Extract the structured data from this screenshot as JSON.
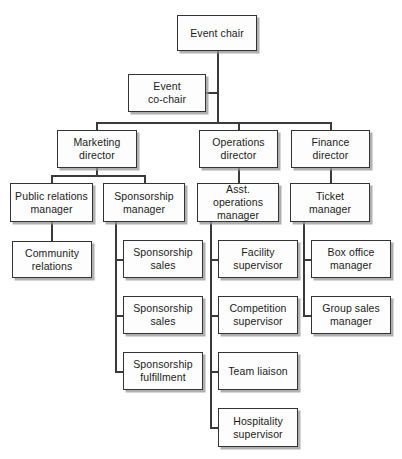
{
  "chart": {
    "type": "org-chart",
    "nodes": [
      {
        "id": "event-chair",
        "label": "Event chair",
        "level": 0,
        "x": 177,
        "y": 15,
        "w": 80,
        "h": 36
      },
      {
        "id": "event-co-chair",
        "label": "Event\nco-chair",
        "level": 1,
        "x": 128,
        "y": 74,
        "w": 78,
        "h": 38
      },
      {
        "id": "marketing-director",
        "label": "Marketing\ndirector",
        "level": 2,
        "x": 57,
        "y": 130,
        "w": 80,
        "h": 38
      },
      {
        "id": "operations-director",
        "label": "Operations\ndirector",
        "level": 2,
        "x": 199,
        "y": 130,
        "w": 79,
        "h": 38
      },
      {
        "id": "finance-director",
        "label": "Finance\ndirector",
        "level": 2,
        "x": 291,
        "y": 130,
        "w": 79,
        "h": 38
      },
      {
        "id": "public-relations-manager",
        "label": "Public relations\nmanager",
        "level": 3,
        "x": 10,
        "y": 183,
        "w": 83,
        "h": 39
      },
      {
        "id": "sponsorship-manager",
        "label": "Sponsorship\nmanager",
        "level": 3,
        "x": 103,
        "y": 183,
        "w": 82,
        "h": 39
      },
      {
        "id": "asst-operations-manager",
        "label": "Asst. operations\nmanager",
        "level": 3,
        "x": 197,
        "y": 183,
        "w": 82,
        "h": 39
      },
      {
        "id": "ticket-manager",
        "label": "Ticket\nmanager",
        "level": 3,
        "x": 290,
        "y": 183,
        "w": 80,
        "h": 39
      },
      {
        "id": "community-relations",
        "label": "Community\nrelations",
        "level": 4,
        "x": 12,
        "y": 241,
        "w": 80,
        "h": 37
      },
      {
        "id": "sponsorship-sales-1",
        "label": "Sponsorship\nsales",
        "level": 4,
        "x": 123,
        "y": 240,
        "w": 80,
        "h": 38
      },
      {
        "id": "sponsorship-sales-2",
        "label": "Sponsorship\nsales",
        "level": 4,
        "x": 123,
        "y": 296,
        "w": 80,
        "h": 38
      },
      {
        "id": "sponsorship-fulfillment",
        "label": "Sponsorship\nfulfillment",
        "level": 4,
        "x": 123,
        "y": 352,
        "w": 80,
        "h": 38
      },
      {
        "id": "facility-supervisor",
        "label": "Facility\nsupervisor",
        "level": 4,
        "x": 218,
        "y": 240,
        "w": 80,
        "h": 38
      },
      {
        "id": "competition-supervisor",
        "label": "Competition\nsupervisor",
        "level": 4,
        "x": 218,
        "y": 296,
        "w": 80,
        "h": 38
      },
      {
        "id": "team-liaison",
        "label": "Team liaison",
        "level": 4,
        "x": 218,
        "y": 352,
        "w": 80,
        "h": 38
      },
      {
        "id": "hospitality-supervisor",
        "label": "Hospitality\nsupervisor",
        "level": 4,
        "x": 218,
        "y": 408,
        "w": 80,
        "h": 39
      },
      {
        "id": "box-office-manager",
        "label": "Box office\nmanager",
        "level": 4,
        "x": 311,
        "y": 240,
        "w": 80,
        "h": 38
      },
      {
        "id": "group-sales-manager",
        "label": "Group sales\nmanager",
        "level": 4,
        "x": 311,
        "y": 296,
        "w": 80,
        "h": 38
      }
    ],
    "connectors": [
      {
        "id": "chair-down",
        "orient": "v",
        "x": 217,
        "y": 51,
        "len": 71
      },
      {
        "id": "cochair-stub",
        "orient": "h",
        "x": 206,
        "y": 92,
        "len": 12
      },
      {
        "id": "cochair-down-to-bus",
        "orient": "v",
        "x": 217,
        "y": 112,
        "len": 11
      },
      {
        "id": "director-bus",
        "orient": "h",
        "x": 96,
        "y": 122,
        "len": 235
      },
      {
        "id": "marketing-drop",
        "orient": "v",
        "x": 96,
        "y": 122,
        "len": 9
      },
      {
        "id": "operations-drop",
        "orient": "v",
        "x": 238,
        "y": 122,
        "len": 9
      },
      {
        "id": "finance-drop",
        "orient": "v",
        "x": 330,
        "y": 122,
        "len": 9
      },
      {
        "id": "marketing-stem",
        "orient": "v",
        "x": 96,
        "y": 168,
        "len": 8
      },
      {
        "id": "marketing-split-bus",
        "orient": "h",
        "x": 51,
        "y": 175,
        "len": 94
      },
      {
        "id": "pr-drop",
        "orient": "v",
        "x": 51,
        "y": 175,
        "len": 9
      },
      {
        "id": "sponsorship-mgr-drop",
        "orient": "v",
        "x": 144,
        "y": 175,
        "len": 9
      },
      {
        "id": "operations-stem",
        "orient": "v",
        "x": 238,
        "y": 168,
        "len": 16
      },
      {
        "id": "finance-stem",
        "orient": "v",
        "x": 330,
        "y": 168,
        "len": 16
      },
      {
        "id": "pr-to-community",
        "orient": "v",
        "x": 51,
        "y": 222,
        "len": 20
      },
      {
        "id": "sponsorship-spine",
        "orient": "v",
        "x": 115,
        "y": 222,
        "len": 150
      },
      {
        "id": "sponsorship-branch-1",
        "orient": "h",
        "x": 115,
        "y": 259,
        "len": 9
      },
      {
        "id": "sponsorship-branch-2",
        "orient": "h",
        "x": 115,
        "y": 315,
        "len": 9
      },
      {
        "id": "sponsorship-branch-3",
        "orient": "h",
        "x": 115,
        "y": 371,
        "len": 9
      },
      {
        "id": "operations-spine",
        "orient": "v",
        "x": 210,
        "y": 222,
        "len": 206
      },
      {
        "id": "operations-branch-1",
        "orient": "h",
        "x": 210,
        "y": 259,
        "len": 9
      },
      {
        "id": "operations-branch-2",
        "orient": "h",
        "x": 210,
        "y": 315,
        "len": 9
      },
      {
        "id": "operations-branch-3",
        "orient": "h",
        "x": 210,
        "y": 371,
        "len": 9
      },
      {
        "id": "operations-branch-4",
        "orient": "h",
        "x": 210,
        "y": 427,
        "len": 9
      },
      {
        "id": "finance-spine",
        "orient": "v",
        "x": 303,
        "y": 222,
        "len": 94
      },
      {
        "id": "finance-branch-1",
        "orient": "h",
        "x": 303,
        "y": 259,
        "len": 9
      },
      {
        "id": "finance-branch-2",
        "orient": "h",
        "x": 303,
        "y": 315,
        "len": 9
      }
    ]
  }
}
